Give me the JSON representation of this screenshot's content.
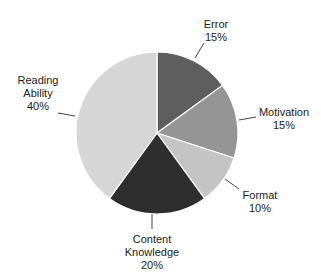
{
  "chart_data": {
    "type": "pie",
    "title": "",
    "start_angle_deg": 0,
    "direction": "clockwise",
    "slices": [
      {
        "label": "Error",
        "value": 15,
        "pct_label": "15%",
        "color": "#5e5e5e"
      },
      {
        "label": "Motivation",
        "value": 15,
        "pct_label": "15%",
        "color": "#959595"
      },
      {
        "label": "Format",
        "value": 10,
        "pct_label": "10%",
        "color": "#c4c4c4"
      },
      {
        "label": "Content Knowledge",
        "value": 20,
        "pct_label": "20%",
        "color": "#2e2e2e"
      },
      {
        "label": "Reading Ability",
        "value": 40,
        "pct_label": "40%",
        "color": "#d6d6d6"
      }
    ],
    "legend": "none (callout labels)"
  },
  "labels": {
    "error": {
      "line1": "Error",
      "line2": "15%"
    },
    "motivation": {
      "line1": "Motivation",
      "line2": "15%"
    },
    "format": {
      "line1": "Format",
      "line2": "10%"
    },
    "content": {
      "line1": "Content",
      "line2": "Knowledge",
      "line3": "20%"
    },
    "reading": {
      "line1": "Reading",
      "line2": "Ability",
      "line3": "40%"
    }
  }
}
